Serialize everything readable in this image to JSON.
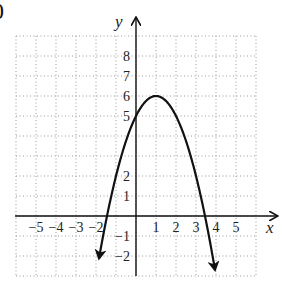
{
  "problem": {
    "number_fragment": "0"
  },
  "chart_data": {
    "type": "line",
    "title": "",
    "xlabel": "x",
    "ylabel": "y",
    "function": "y = -(x - 1)^2 + 6",
    "xlim": [
      -6,
      6
    ],
    "ylim": [
      -3,
      9
    ],
    "grid": true,
    "grid_style": "dotted",
    "x_tick_labels": [
      "-5",
      "-4",
      "-3",
      "-2",
      "1",
      "2",
      "3",
      "4",
      "5"
    ],
    "x_tick_values": [
      -5,
      -4,
      -3,
      -2,
      1,
      2,
      3,
      4,
      5
    ],
    "y_tick_labels": [
      "8",
      "7",
      "6",
      "5",
      "2",
      "1",
      "-1",
      "-2"
    ],
    "y_tick_values": [
      8,
      7,
      6,
      5,
      2,
      1,
      -1,
      -2
    ],
    "vertex": [
      1,
      6
    ],
    "y_intercept": 5,
    "x_intercepts": [
      -1.45,
      3.45
    ],
    "series": [
      {
        "name": "parabola",
        "x": [
          -1.85,
          -1.5,
          -1,
          -0.5,
          0,
          0.5,
          1,
          1.5,
          2,
          2.5,
          3,
          3.5,
          3.95
        ],
        "y": [
          -2.12,
          -0.25,
          2,
          3.75,
          5,
          5.75,
          6,
          5.75,
          5,
          3.75,
          2,
          -0.25,
          -2.7
        ],
        "end_arrows": true
      }
    ]
  }
}
